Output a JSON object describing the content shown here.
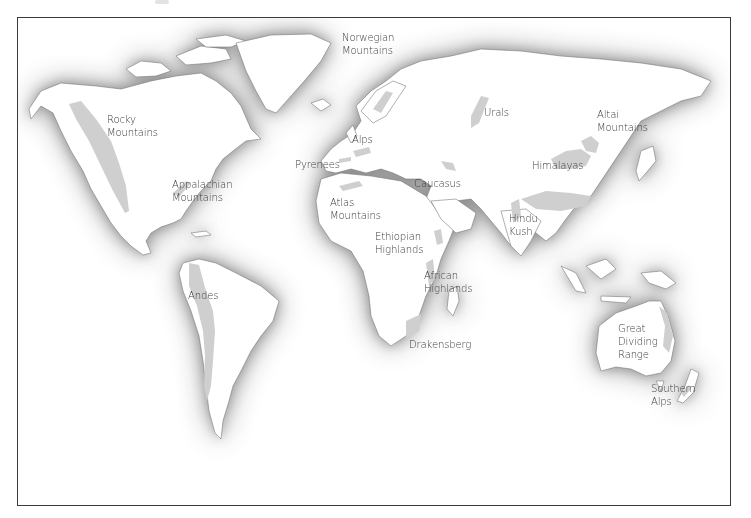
{
  "map": {
    "kind": "world mountain ranges",
    "colors": {
      "land": "#ffffff",
      "ocean_shadow": "#8f8f8f",
      "mountain": "#cfcfcf",
      "border": "#3a3a3a",
      "label": "#3c3c3c"
    },
    "labels": [
      {
        "id": "rocky",
        "text": "Rocky\nMountains",
        "x": 106,
        "y": 112
      },
      {
        "id": "appalachian",
        "text": "Appalachian\nMountains",
        "x": 171,
        "y": 177
      },
      {
        "id": "andes",
        "text": "Andes",
        "x": 187,
        "y": 288
      },
      {
        "id": "norwegian",
        "text": "Norwegian\nMountains",
        "x": 341,
        "y": 30
      },
      {
        "id": "alps",
        "text": "Alps",
        "x": 351,
        "y": 132
      },
      {
        "id": "pyrenees",
        "text": "Pyrenees",
        "x": 294,
        "y": 157
      },
      {
        "id": "atlas",
        "text": "Atlas\nMountains",
        "x": 329,
        "y": 195
      },
      {
        "id": "caucasus",
        "text": "Caucasus",
        "x": 413,
        "y": 176
      },
      {
        "id": "urals",
        "text": "Urals",
        "x": 483,
        "y": 105
      },
      {
        "id": "altai",
        "text": "Altai\nMountains",
        "x": 596,
        "y": 107
      },
      {
        "id": "himalayas",
        "text": "Himalayas",
        "x": 531,
        "y": 158
      },
      {
        "id": "hindu_kush",
        "text": "Hindu\nKush",
        "x": 508,
        "y": 211
      },
      {
        "id": "ethiopian",
        "text": "Ethiopian\nHighlands",
        "x": 374,
        "y": 229
      },
      {
        "id": "african",
        "text": "African\nHighlands",
        "x": 423,
        "y": 268
      },
      {
        "id": "drakensberg",
        "text": "Drakensberg",
        "x": 408,
        "y": 337
      },
      {
        "id": "great_dividing",
        "text": "Great\nDividing\nRange",
        "x": 617,
        "y": 321
      },
      {
        "id": "southern_alps",
        "text": "Southern\nAlps",
        "x": 650,
        "y": 381
      }
    ]
  }
}
